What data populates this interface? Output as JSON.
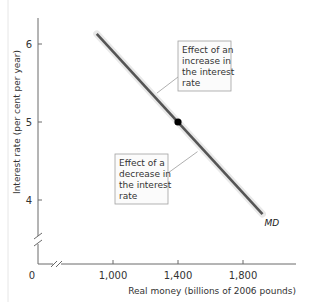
{
  "chart_data": {
    "type": "line",
    "title": "",
    "xlabel": "Real money (billions of 2006 pounds)",
    "ylabel": "Interest rate (per cent per year)",
    "xlim": [
      600,
      2100
    ],
    "ylim": [
      3.2,
      6.3
    ],
    "axis_breaks": {
      "x": true,
      "y": true
    },
    "origin_label": "0",
    "x_ticks": [
      {
        "value": 1000,
        "label": "1,000"
      },
      {
        "value": 1400,
        "label": "1,400"
      },
      {
        "value": 1800,
        "label": "1,800"
      }
    ],
    "y_ticks": [
      {
        "value": 4,
        "label": "4"
      },
      {
        "value": 5,
        "label": "5"
      },
      {
        "value": 6,
        "label": "6"
      }
    ],
    "grid": false,
    "series": [
      {
        "name": "MD",
        "label": "MD",
        "color": "#555555",
        "points": [
          [
            900,
            6.13
          ],
          [
            1920,
            3.82
          ]
        ]
      }
    ],
    "highlight_point": {
      "x": 1400,
      "y": 5,
      "color": "#000000"
    },
    "annotations": [
      {
        "id": "increase",
        "lines": [
          "Effect of an",
          "increase in",
          "the interest",
          "rate"
        ],
        "anchor": {
          "x": 1270,
          "y": 5.37
        },
        "placement": "upper-right"
      },
      {
        "id": "decrease",
        "lines": [
          "Effect of a",
          "decrease in",
          "the interest",
          "rate"
        ],
        "anchor": {
          "x": 1520,
          "y": 4.62
        },
        "placement": "lower-left"
      }
    ],
    "legend": "none"
  },
  "colors": {
    "axis": "#6a6a6a",
    "line": "#555555",
    "line_glow": "#d8d8d8",
    "box_border": "#a0a0a0",
    "box_fill": "#fbfbfb",
    "leader": "#9a9a9a"
  }
}
